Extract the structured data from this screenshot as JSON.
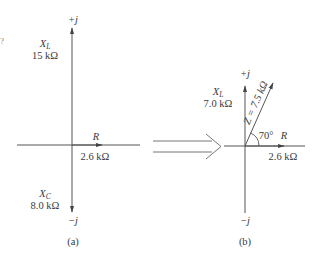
{
  "figure": {
    "edge_fragment": "?",
    "arrow_between": "double-arrow-right",
    "panel_a": {
      "caption": "(a)",
      "pos_j_label": "+j",
      "neg_j_label": "−j",
      "xl": {
        "symbol": "X",
        "sub": "L",
        "value": "15 kΩ"
      },
      "xc": {
        "symbol": "X",
        "sub": "C",
        "value": "8.0 kΩ"
      },
      "r": {
        "symbol": "R",
        "value": "2.6 kΩ"
      }
    },
    "panel_b": {
      "caption": "(b)",
      "pos_j_label": "+j",
      "neg_j_label": "−j",
      "xl": {
        "symbol": "X",
        "sub": "L",
        "value": "7.0 kΩ"
      },
      "r": {
        "symbol": "R",
        "value": "2.6 kΩ"
      },
      "z": {
        "label": "Z = 7.5 kΩ"
      },
      "angle": "70°"
    },
    "colors": {
      "line": "#555555",
      "text": "#3a3a3a",
      "background": "#ffffff"
    }
  }
}
